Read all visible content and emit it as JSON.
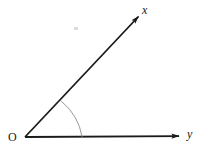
{
  "figure": {
    "kind": "geometry-angle-diagram",
    "width": 211,
    "height": 153,
    "background_color": "#ffffff"
  },
  "labels": {
    "vertex": "O",
    "ray_upper": "x",
    "ray_lower": "y"
  },
  "colors": {
    "ray_stroke": "#1a1a1a",
    "arc_stroke": "#8c8c8c",
    "label_text": "#1a1a1a",
    "stray_mark": "#d9d9d9"
  },
  "geometry": {
    "vertex": {
      "x": 25,
      "y": 137
    },
    "ray_upper": {
      "name": "ray-x",
      "from": {
        "x": 25,
        "y": 137
      },
      "to": {
        "x": 141,
        "y": 14
      },
      "arrowhead": "filled-triangle",
      "stroke_width": 1.8
    },
    "ray_lower": {
      "name": "ray-y",
      "from": {
        "x": 25,
        "y": 137
      },
      "to": {
        "x": 182,
        "y": 136
      },
      "arrowhead": "filled-triangle",
      "stroke_width": 1.8
    },
    "angle_arc": {
      "radius": 57,
      "start": {
        "x": 61,
        "y": 101
      },
      "end": {
        "x": 82,
        "y": 136
      },
      "stroke_width": 0.9
    },
    "angle_degrees": 46
  }
}
